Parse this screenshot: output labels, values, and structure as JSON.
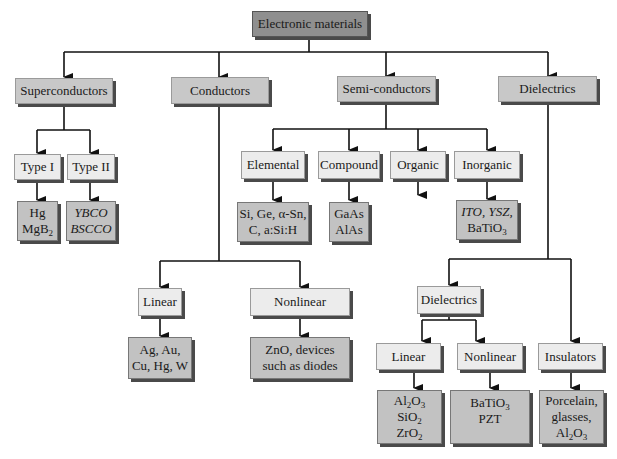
{
  "root": {
    "label": "Electronic materials"
  },
  "level1": {
    "superconductors": "Superconductors",
    "conductors": "Conductors",
    "semiconductors": "Semi-conductors",
    "dielectrics": "Dielectrics"
  },
  "superconductors": {
    "type1": {
      "label": "Type I",
      "examples": [
        "Hg",
        "MgB",
        "2"
      ]
    },
    "type2": {
      "label": "Type II",
      "examples": [
        "YBCO",
        "BSCCO"
      ]
    }
  },
  "conductors": {
    "linear": {
      "label": "Linear",
      "examples": [
        "Ag, Au,",
        "Cu, Hg, W"
      ]
    },
    "nonlinear": {
      "label": "Nonlinear",
      "examples": [
        "ZnO, devices",
        "such as diodes"
      ]
    }
  },
  "semiconductors": {
    "elemental": {
      "label": "Elemental",
      "examples": [
        "Si, Ge, α-Sn,",
        "C, a:Si:H"
      ]
    },
    "compound": {
      "label": "Compound",
      "examples": [
        "GaAs",
        "AlAs"
      ]
    },
    "organic": {
      "label": "Organic"
    },
    "inorganic": {
      "label": "Inorganic",
      "examples": [
        "ITO, YSZ,",
        "BaTiO",
        "3"
      ]
    }
  },
  "dielectrics": {
    "sub": {
      "label": "Dielectrics"
    },
    "linear": {
      "label": "Linear",
      "examples": [
        "Al",
        "2",
        "O",
        "3",
        "SiO",
        "2",
        "ZrO",
        "2"
      ]
    },
    "nonlinear": {
      "label": "Nonlinear",
      "examples": [
        "BaTiO",
        "3",
        "PZT"
      ]
    },
    "insulators": {
      "label": "Insulators",
      "examples": [
        "Porcelain,",
        "glasses,",
        "Al",
        "2",
        "O",
        "3"
      ]
    }
  }
}
